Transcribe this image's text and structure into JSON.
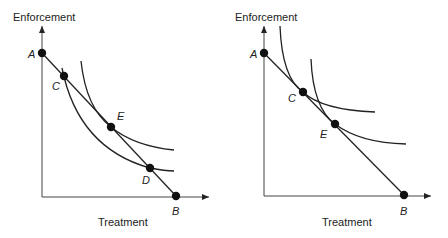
{
  "panels": [
    {
      "id": "left",
      "y_axis_label": "Enforcement",
      "x_axis_label": "Treatment",
      "points": {
        "A": {
          "label": "A"
        },
        "B": {
          "label": "B"
        },
        "C": {
          "label": "C"
        },
        "D": {
          "label": "D"
        },
        "E": {
          "label": "E"
        }
      },
      "description": "Budget line AB with two indifference curves: lower curve crossing line at C and D, higher curve tangent at E"
    },
    {
      "id": "right",
      "y_axis_label": "Enforcement",
      "x_axis_label": "Treatment",
      "points": {
        "A": {
          "label": "A"
        },
        "B": {
          "label": "B"
        },
        "C": {
          "label": "C"
        },
        "E": {
          "label": "E"
        }
      },
      "description": "Budget line AB with two indifference curves tangent at C and E"
    }
  ],
  "colors": {
    "line": "#222222",
    "point": "#111111",
    "background": "#ffffff"
  }
}
